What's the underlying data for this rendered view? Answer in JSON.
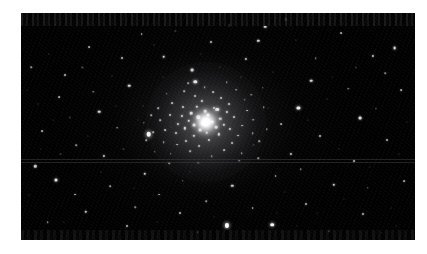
{
  "figure": {
    "kind": "astronomical-photograph",
    "caption": "",
    "background_color": "#ffffff",
    "sky_color": "#000000",
    "star_color": "#ffffff"
  },
  "plate": {
    "left": 21,
    "top": 13,
    "width": 394,
    "height": 227
  },
  "cluster": {
    "center_x_pct": 47.0,
    "center_y_pct": 48.0,
    "core_diameter_px": 34,
    "halo_diameter_px": 120,
    "label": "cluster-core"
  },
  "artifacts": {
    "scanlines_y_pct": [
      64.5,
      65.6
    ],
    "top_noise_band_height": 13,
    "bottom_noise_band_height": 10
  },
  "chart_data": {
    "type": "scatter",
    "title": "",
    "xlabel": "",
    "ylabel": "",
    "xlim": [
      0,
      100
    ],
    "ylim": [
      0,
      100
    ],
    "grid": false,
    "legend": null,
    "note": "Positions are percentages of the photographic plate; size is apparent stellar diameter in px; brightness is relative 0-1.",
    "series": [
      {
        "name": "cluster-core-members",
        "points": [
          [
            45.0,
            46.0,
            3.4,
            1.0
          ],
          [
            47.5,
            45.0,
            3.0,
            1.0
          ],
          [
            46.2,
            48.5,
            3.6,
            1.0
          ],
          [
            44.0,
            49.5,
            2.8,
            0.96
          ],
          [
            48.6,
            48.0,
            2.9,
            0.97
          ],
          [
            46.8,
            43.2,
            2.6,
            0.93
          ],
          [
            43.2,
            44.2,
            2.5,
            0.9
          ],
          [
            49.6,
            50.4,
            2.7,
            0.94
          ],
          [
            45.4,
            51.6,
            2.8,
            0.95
          ],
          [
            42.6,
            47.6,
            2.4,
            0.88
          ],
          [
            50.6,
            46.6,
            2.5,
            0.9
          ],
          [
            47.2,
            52.8,
            2.5,
            0.9
          ],
          [
            41.6,
            50.8,
            2.3,
            0.85
          ],
          [
            51.4,
            49.2,
            2.3,
            0.85
          ],
          [
            44.6,
            41.4,
            2.3,
            0.85
          ],
          [
            49.0,
            41.8,
            2.2,
            0.83
          ],
          [
            40.8,
            45.2,
            2.2,
            0.82
          ],
          [
            52.2,
            43.6,
            2.2,
            0.82
          ],
          [
            43.8,
            54.0,
            2.3,
            0.84
          ],
          [
            50.2,
            53.4,
            2.3,
            0.84
          ],
          [
            39.8,
            48.8,
            2.1,
            0.8
          ],
          [
            53.0,
            51.0,
            2.1,
            0.8
          ],
          [
            46.0,
            38.6,
            2.2,
            0.82
          ],
          [
            41.0,
            41.6,
            2.0,
            0.78
          ],
          [
            52.8,
            40.2,
            2.0,
            0.78
          ],
          [
            39.4,
            53.0,
            2.0,
            0.77
          ],
          [
            54.0,
            46.0,
            2.0,
            0.78
          ],
          [
            47.8,
            56.0,
            2.1,
            0.79
          ],
          [
            42.0,
            56.4,
            2.0,
            0.76
          ],
          [
            37.8,
            44.8,
            1.9,
            0.74
          ],
          [
            55.0,
            54.0,
            1.9,
            0.74
          ],
          [
            50.8,
            37.4,
            1.9,
            0.74
          ],
          [
            44.2,
            36.6,
            1.9,
            0.73
          ],
          [
            38.4,
            39.8,
            1.8,
            0.7
          ],
          [
            56.2,
            49.6,
            1.8,
            0.7
          ],
          [
            36.6,
            51.6,
            1.8,
            0.7
          ],
          [
            53.6,
            57.4,
            1.9,
            0.72
          ],
          [
            45.2,
            58.8,
            1.9,
            0.72
          ],
          [
            39.6,
            58.0,
            1.8,
            0.7
          ],
          [
            57.4,
            43.0,
            1.8,
            0.69
          ],
          [
            35.4,
            47.2,
            1.7,
            0.66
          ],
          [
            48.8,
            34.8,
            1.8,
            0.68
          ],
          [
            56.8,
            38.2,
            1.7,
            0.66
          ],
          [
            34.8,
            42.0,
            1.7,
            0.65
          ],
          [
            41.4,
            34.4,
            1.7,
            0.65
          ],
          [
            58.8,
            52.8,
            1.7,
            0.65
          ],
          [
            36.2,
            56.8,
            1.7,
            0.64
          ],
          [
            51.6,
            60.4,
            1.8,
            0.66
          ],
          [
            43.0,
            61.0,
            1.7,
            0.64
          ],
          [
            59.0,
            47.0,
            1.7,
            0.64
          ],
          [
            33.6,
            52.6,
            1.6,
            0.61
          ],
          [
            46.6,
            32.6,
            1.7,
            0.63
          ],
          [
            54.6,
            33.8,
            1.6,
            0.61
          ],
          [
            37.0,
            35.6,
            1.6,
            0.6
          ],
          [
            60.4,
            56.6,
            1.6,
            0.6
          ],
          [
            33.0,
            45.0,
            1.6,
            0.6
          ],
          [
            38.0,
            62.0,
            1.6,
            0.59
          ],
          [
            56.0,
            61.8,
            1.6,
            0.59
          ],
          [
            48.4,
            63.2,
            1.6,
            0.59
          ],
          [
            61.6,
            41.6,
            1.6,
            0.58
          ],
          [
            31.8,
            56.0,
            1.5,
            0.56
          ],
          [
            42.4,
            30.8,
            1.6,
            0.58
          ],
          [
            58.4,
            36.0,
            1.5,
            0.56
          ],
          [
            31.2,
            48.4,
            1.5,
            0.56
          ],
          [
            52.2,
            30.6,
            1.5,
            0.55
          ],
          [
            34.0,
            61.2,
            1.5,
            0.55
          ],
          [
            62.4,
            51.2,
            1.5,
            0.55
          ],
          [
            45.0,
            66.0,
            1.5,
            0.55
          ],
          [
            60.2,
            64.0,
            1.5,
            0.54
          ]
        ]
      },
      {
        "name": "bright-field-stars",
        "points": [
          [
            32.4,
            53.4,
            4.6,
            1.0
          ],
          [
            49.8,
            42.6,
            3.8,
            1.0
          ],
          [
            52.2,
            93.6,
            4.2,
            1.0
          ],
          [
            44.2,
            30.2,
            3.4,
            0.95
          ],
          [
            63.8,
            93.2,
            3.6,
            0.96
          ],
          [
            70.4,
            41.8,
            3.2,
            0.92
          ],
          [
            8.8,
            73.6,
            3.0,
            0.9
          ],
          [
            19.8,
            43.4,
            2.6,
            0.84
          ],
          [
            27.4,
            32.0,
            2.6,
            0.84
          ],
          [
            43.4,
            25.0,
            2.8,
            0.86
          ],
          [
            73.6,
            29.8,
            2.6,
            0.83
          ],
          [
            86.0,
            46.4,
            2.8,
            0.86
          ],
          [
            94.8,
            15.6,
            2.8,
            0.86
          ],
          [
            36.2,
            19.2,
            2.6,
            0.82
          ],
          [
            60.2,
            12.2,
            2.4,
            0.8
          ],
          [
            79.4,
            75.6,
            2.4,
            0.79
          ],
          [
            16.4,
            87.6,
            2.4,
            0.78
          ],
          [
            31.4,
            70.8,
            2.4,
            0.78
          ],
          [
            53.6,
            76.2,
            2.4,
            0.78
          ],
          [
            21.0,
            62.8,
            2.2,
            0.75
          ],
          [
            62.0,
            6.0,
            2.6,
            0.82
          ],
          [
            67.2,
            2.8,
            2.2,
            0.74
          ],
          [
            3.6,
            67.6,
            2.4,
            0.78
          ],
          [
            89.4,
            18.8,
            2.2,
            0.74
          ],
          [
            25.6,
            20.0,
            2.0,
            0.7
          ],
          [
            11.2,
            27.4,
            2.0,
            0.7
          ],
          [
            48.2,
            12.6,
            2.0,
            0.7
          ],
          [
            57.0,
            20.4,
            2.2,
            0.73
          ],
          [
            68.6,
            62.0,
            2.2,
            0.73
          ],
          [
            76.0,
            54.0,
            2.0,
            0.7
          ],
          [
            84.6,
            65.0,
            2.0,
            0.69
          ],
          [
            93.0,
            56.0,
            2.0,
            0.69
          ],
          [
            72.4,
            84.0,
            2.0,
            0.68
          ],
          [
            86.8,
            88.6,
            2.0,
            0.68
          ],
          [
            40.4,
            88.0,
            2.0,
            0.68
          ],
          [
            27.0,
            94.0,
            2.0,
            0.67
          ],
          [
            13.8,
            80.0,
            1.9,
            0.66
          ],
          [
            5.4,
            52.0,
            1.8,
            0.64
          ],
          [
            9.6,
            37.0,
            1.8,
            0.63
          ],
          [
            17.2,
            15.0,
            1.8,
            0.62
          ],
          [
            30.6,
            9.4,
            1.8,
            0.62
          ],
          [
            52.8,
            5.2,
            1.8,
            0.62
          ],
          [
            81.2,
            9.0,
            1.8,
            0.62
          ],
          [
            96.4,
            34.0,
            1.8,
            0.62
          ],
          [
            97.2,
            74.0,
            1.8,
            0.61
          ],
          [
            64.6,
            72.0,
            1.8,
            0.61
          ],
          [
            58.8,
            86.0,
            1.8,
            0.61
          ],
          [
            35.0,
            80.0,
            1.8,
            0.6
          ],
          [
            22.6,
            76.4,
            1.7,
            0.58
          ],
          [
            6.8,
            92.0,
            1.7,
            0.58
          ],
          [
            44.8,
            96.6,
            1.7,
            0.58
          ],
          [
            78.2,
            96.0,
            1.7,
            0.57
          ],
          [
            91.6,
            96.8,
            1.6,
            0.55
          ],
          [
            2.6,
            24.0,
            1.6,
            0.55
          ],
          [
            24.4,
            50.6,
            1.6,
            0.55
          ],
          [
            14.0,
            58.2,
            1.6,
            0.54
          ],
          [
            66.0,
            49.0,
            1.8,
            0.6
          ],
          [
            71.0,
            68.8,
            1.6,
            0.54
          ],
          [
            83.0,
            33.4,
            1.6,
            0.54
          ],
          [
            88.0,
            77.0,
            1.6,
            0.53
          ],
          [
            37.6,
            66.2,
            1.6,
            0.53
          ],
          [
            18.4,
            34.6,
            1.5,
            0.51
          ],
          [
            47.0,
            83.0,
            1.6,
            0.53
          ],
          [
            29.0,
            85.6,
            1.5,
            0.5
          ],
          [
            55.4,
            65.0,
            1.6,
            0.53
          ],
          [
            74.8,
            20.0,
            1.5,
            0.5
          ],
          [
            92.4,
            26.6,
            1.5,
            0.5
          ],
          [
            61.4,
            33.0,
            1.5,
            0.5
          ],
          [
            41.0,
            74.0,
            1.5,
            0.5
          ]
        ]
      },
      {
        "name": "faint-field-stars",
        "points": [
          [
            7.0,
            18.0,
            1.2,
            0.34
          ],
          [
            12.4,
            46.0,
            1.2,
            0.32
          ],
          [
            23.0,
            27.6,
            1.2,
            0.33
          ],
          [
            33.8,
            14.2,
            1.2,
            0.33
          ],
          [
            39.2,
            8.0,
            1.2,
            0.32
          ],
          [
            55.8,
            28.0,
            1.2,
            0.34
          ],
          [
            69.8,
            12.0,
            1.2,
            0.32
          ],
          [
            77.6,
            38.0,
            1.2,
            0.32
          ],
          [
            90.0,
            42.0,
            1.2,
            0.32
          ],
          [
            96.0,
            62.0,
            1.2,
            0.31
          ],
          [
            4.2,
            40.0,
            1.2,
            0.31
          ],
          [
            10.0,
            62.0,
            1.2,
            0.31
          ],
          [
            20.2,
            70.0,
            1.2,
            0.31
          ],
          [
            26.0,
            60.0,
            1.2,
            0.31
          ],
          [
            31.0,
            41.0,
            1.2,
            0.32
          ],
          [
            15.6,
            24.0,
            1.1,
            0.28
          ],
          [
            45.6,
            18.0,
            1.1,
            0.29
          ],
          [
            50.4,
            23.6,
            1.1,
            0.29
          ],
          [
            64.0,
            26.0,
            1.1,
            0.29
          ],
          [
            72.8,
            47.0,
            1.1,
            0.29
          ],
          [
            80.6,
            60.0,
            1.1,
            0.28
          ],
          [
            85.0,
            24.0,
            1.1,
            0.28
          ],
          [
            94.0,
            86.0,
            1.1,
            0.28
          ],
          [
            2.0,
            80.0,
            1.1,
            0.27
          ],
          [
            8.0,
            47.0,
            1.1,
            0.27
          ],
          [
            17.0,
            54.0,
            1.1,
            0.27
          ],
          [
            24.0,
            41.0,
            1.1,
            0.28
          ],
          [
            36.0,
            28.0,
            1.1,
            0.28
          ],
          [
            59.0,
            58.0,
            1.1,
            0.28
          ],
          [
            67.0,
            79.0,
            1.1,
            0.27
          ],
          [
            75.0,
            88.0,
            1.1,
            0.27
          ],
          [
            82.0,
            82.0,
            1.1,
            0.26
          ],
          [
            98.0,
            48.0,
            1.1,
            0.26
          ],
          [
            5.0,
            60.0,
            1.0,
            0.24
          ],
          [
            28.6,
            77.0,
            1.0,
            0.24
          ],
          [
            34.4,
            92.0,
            1.0,
            0.24
          ],
          [
            43.0,
            70.0,
            1.0,
            0.25
          ],
          [
            49.0,
            90.0,
            1.0,
            0.24
          ],
          [
            56.4,
            96.0,
            1.0,
            0.23
          ],
          [
            65.0,
            88.0,
            1.0,
            0.23
          ],
          [
            70.0,
            94.0,
            1.0,
            0.23
          ],
          [
            88.6,
            68.0,
            1.0,
            0.23
          ],
          [
            95.2,
            94.0,
            1.0,
            0.22
          ],
          [
            1.6,
            34.0,
            1.0,
            0.22
          ],
          [
            11.0,
            92.0,
            1.0,
            0.22
          ],
          [
            21.8,
            96.0,
            1.0,
            0.22
          ],
          [
            38.0,
            50.0,
            1.0,
            0.24
          ],
          [
            29.8,
            47.0,
            1.0,
            0.24
          ],
          [
            62.6,
            42.0,
            1.0,
            0.24
          ],
          [
            79.0,
            28.0,
            1.0,
            0.23
          ]
        ]
      }
    ]
  }
}
